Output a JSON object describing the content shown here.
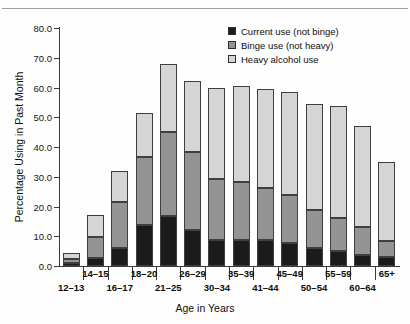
{
  "top_caption": "",
  "chart_data": {
    "type": "bar",
    "subtype": "stacked-vertical",
    "title": "",
    "xlabel": "Age in Years",
    "ylabel": "Percentage Using in Past Month",
    "ylim": [
      0.0,
      80.0
    ],
    "ytick_step": 10.0,
    "ytick_labels": [
      "0.0",
      "10.0",
      "20.0",
      "30.0",
      "40.0",
      "50.0",
      "60.0",
      "70.0",
      "80.0"
    ],
    "ytick_values": [
      0.0,
      10.0,
      20.0,
      30.0,
      40.0,
      50.0,
      60.0,
      70.0,
      80.0
    ],
    "grid": false,
    "legend_position": "top-right",
    "categories": [
      "12–13",
      "14–15",
      "16–17",
      "18–20",
      "21–25",
      "26–29",
      "30–34",
      "35–39",
      "41–44",
      "45–49",
      "50–54",
      "55–59",
      "60–64",
      "65+"
    ],
    "series": [
      {
        "name": "Current use (not binge)",
        "color": "#1b1b1b",
        "values": [
          1.0,
          2.6,
          6.2,
          13.8,
          16.8,
          12.0,
          8.8,
          8.8,
          8.9,
          7.6,
          6.2,
          5.0,
          3.8,
          3.0
        ]
      },
      {
        "name": "Binge use (not heavy)",
        "color": "#949494",
        "values": [
          1.2,
          7.0,
          15.3,
          22.7,
          28.4,
          26.4,
          20.6,
          19.6,
          17.3,
          16.2,
          12.6,
          11.3,
          9.4,
          5.5
        ]
      },
      {
        "name": "Heavy alcohol use",
        "color": "#d5d5d5",
        "values": [
          2.3,
          7.6,
          10.4,
          14.9,
          22.8,
          23.9,
          30.3,
          32.0,
          33.2,
          34.7,
          35.5,
          37.5,
          33.9,
          26.6
        ]
      }
    ],
    "totals": [
      4.5,
      17.2,
      31.9,
      51.4,
      68.0,
      62.3,
      59.7,
      60.4,
      59.4,
      58.5,
      54.3,
      53.8,
      47.1,
      35.1
    ]
  },
  "legend": {
    "items": [
      {
        "label": "Current use (not binge)",
        "color": "#1b1b1b"
      },
      {
        "label": "Binge use (not heavy)",
        "color": "#949494"
      },
      {
        "label": "Heavy alcohol use",
        "color": "#d5d5d5"
      }
    ]
  }
}
